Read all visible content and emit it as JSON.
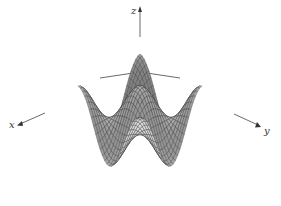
{
  "chart_data": {
    "type": "surface3d",
    "title": "",
    "function": "z = cos(x) * cos(y)",
    "axes": {
      "x": {
        "label": "x",
        "range": [
          -3.14159,
          3.14159
        ]
      },
      "y": {
        "label": "y",
        "range": [
          -3.14159,
          3.14159
        ]
      },
      "z": {
        "label": "z",
        "range": [
          -1,
          1
        ]
      }
    },
    "grid_lines_per_axis": 28,
    "features": {
      "peaks": [
        {
          "name": "back-center",
          "x": -3.14159,
          "y": -3.14159,
          "z": 1
        },
        {
          "name": "left",
          "x": 3.14159,
          "y": -3.14159,
          "z": -1
        },
        {
          "name": "center",
          "x": 0,
          "y": 0,
          "z": 1
        },
        {
          "name": "right",
          "x": -3.14159,
          "y": 3.14159,
          "z": -1
        },
        {
          "name": "front",
          "x": 3.14159,
          "y": 3.14159,
          "z": 1
        }
      ]
    },
    "colors": {
      "background": "#ffffff",
      "surface_light": "#e8e8e8",
      "surface_dark": "#6a6a6a",
      "mesh_line": "#333333",
      "axis": "#444444"
    }
  }
}
